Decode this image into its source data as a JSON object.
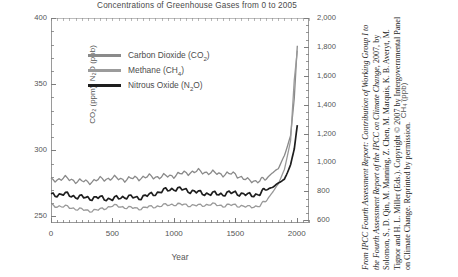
{
  "chart_data": {
    "type": "line",
    "title": "Concentrations of Greenhouse Gases from 0 to 2005",
    "xlabel": "Year",
    "ylabel_left": "CO₂ (ppm), N₂O (ppb)",
    "ylabel_right": "CH₄ (ppb)",
    "xlim": [
      0,
      2100
    ],
    "xticks": [
      "0",
      "500",
      "1000",
      "1500",
      "2000"
    ],
    "xtick_values": [
      0,
      500,
      1000,
      1500,
      2000
    ],
    "ylim_left": [
      245,
      400
    ],
    "yticks_left": [
      "250",
      "300",
      "350",
      "400"
    ],
    "ytick_values_left": [
      250,
      300,
      350,
      400
    ],
    "ylim_right": [
      580,
      2000
    ],
    "yticks_right": [
      "600",
      "800",
      "1,000",
      "1,200",
      "1,400",
      "1,600",
      "1,800",
      "2,000"
    ],
    "ytick_values_right": [
      600,
      800,
      1000,
      1200,
      1400,
      1600,
      1800,
      2000
    ],
    "grid": false,
    "legend_position": "upper-left-inside",
    "series": [
      {
        "name": "Carbon Dioxide (CO₂)",
        "axis": "left",
        "units": "ppm",
        "color": "#8a8a8a",
        "x": [
          0,
          100,
          200,
          300,
          400,
          500,
          600,
          700,
          800,
          900,
          1000,
          1100,
          1200,
          1300,
          1400,
          1500,
          1600,
          1700,
          1750,
          1800,
          1850,
          1900,
          1950,
          1980,
          2005
        ],
        "y": [
          277,
          279,
          277,
          276,
          278,
          279,
          278,
          279,
          280,
          280,
          281,
          283,
          284,
          283,
          282,
          282,
          277,
          277,
          278,
          283,
          286,
          296,
          311,
          339,
          379
        ]
      },
      {
        "name": "Methane (CH₄)",
        "axis": "right",
        "units": "ppb",
        "color": "#999999",
        "x": [
          0,
          100,
          200,
          300,
          400,
          500,
          600,
          700,
          800,
          900,
          1000,
          1100,
          1200,
          1300,
          1400,
          1500,
          1600,
          1700,
          1750,
          1800,
          1850,
          1900,
          1950,
          1980,
          2005
        ],
        "y": [
          700,
          695,
          680,
          665,
          672,
          700,
          690,
          680,
          690,
          700,
          710,
          705,
          700,
          710,
          700,
          705,
          690,
          700,
          730,
          790,
          850,
          950,
          1150,
          1570,
          1774
        ]
      },
      {
        "name": "Nitrous Oxide (N₂O)",
        "axis": "left",
        "units": "ppb",
        "color": "#1e1e1e",
        "x": [
          0,
          100,
          200,
          300,
          400,
          500,
          600,
          700,
          800,
          900,
          1000,
          1100,
          1200,
          1300,
          1400,
          1500,
          1600,
          1700,
          1750,
          1800,
          1850,
          1900,
          1950,
          1980,
          2005
        ],
        "y": [
          266,
          267,
          265,
          264,
          264,
          263,
          265,
          264,
          266,
          269,
          271,
          270,
          268,
          267,
          267,
          268,
          266,
          267,
          270,
          272,
          275,
          278,
          289,
          301,
          319
        ]
      }
    ]
  },
  "legend": {
    "items": [
      {
        "label": "Carbon Dioxide (CO",
        "sub": "2",
        "tail": ")",
        "color": "#8a8a8a"
      },
      {
        "label": "Methane (CH",
        "sub": "4",
        "tail": ")",
        "color": "#9b9b9b"
      },
      {
        "label": "Nitrous Oxide (N",
        "sub": "2",
        "tail": "O)",
        "color": "#1e1e1e"
      }
    ]
  },
  "caption": {
    "text": "From IPCC Fourth Assessment Report: Contribution of Working Group I to the Fourth Assessment Report of the IPCC on Climate Change, 2007, by Solomon, S., D. Qin, M. Manning, Z. Chen, M. Marquis, K. B. Averyt, M. Tignor and H. L. Miller (Eds.). Copyright © 2007 by Intergovernmental Panel on Climate Change. Reprinted by permission.",
    "italic_1": "From IPCC Fourth Assessment Report: Contribution of Working Group I to the Fourth Assessment Report of the IPCC on Climate Change,",
    "rest": " 2007, by Solomon, S., D. Qin, M. Manning, Z. Chen, M. Marquis, K. B. Averyt, M. Tignor and H. L. Miller (Eds.). Copyright © 2007 by Intergovernmental Panel on Climate Change. Reprinted by permission."
  }
}
